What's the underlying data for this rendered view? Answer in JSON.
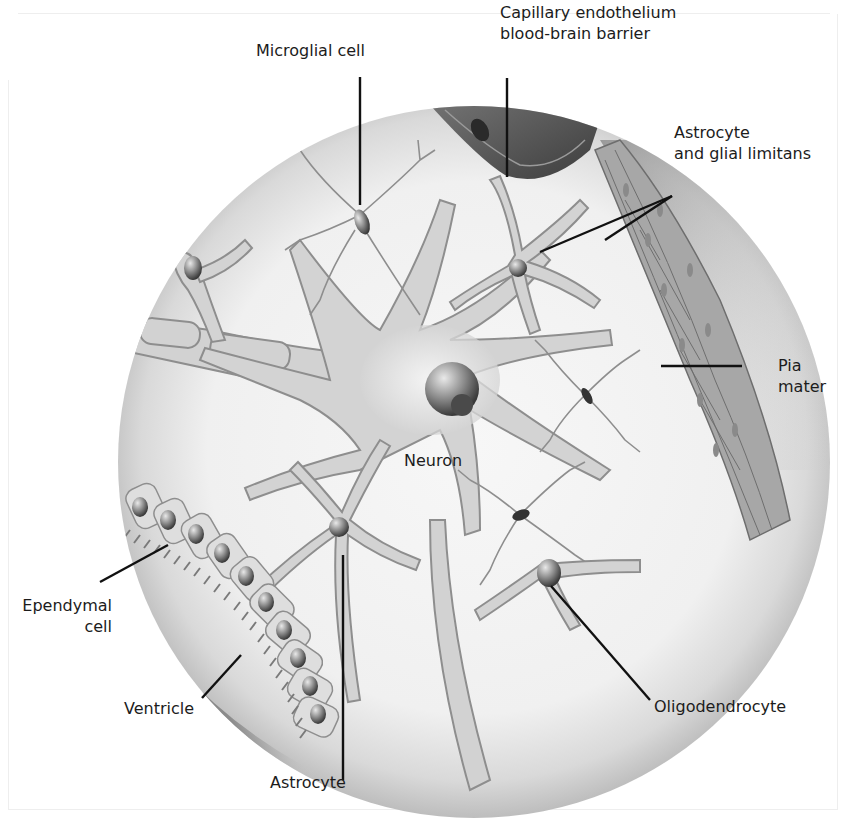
{
  "diagram": {
    "colors": {
      "background": "#ffffff",
      "tissue": "#efefef",
      "cell_fill": "#d2d2d2",
      "cell_outline": "#8e8e8e",
      "nucleus_dark": "#2e2e2e",
      "capillary": "#5a5a5a",
      "pia": "#9d9d9d",
      "ventricle": "#6b6b6b",
      "leader_line": "#111111",
      "text": "#1c1c1c"
    },
    "labels": {
      "microglial": "Microglial cell",
      "capillary_line1": "Capillary endothelium",
      "capillary_line2": "blood-brain barrier",
      "astro_glial_line1": "Astrocyte",
      "astro_glial_line2": "and glial limitans",
      "pia_line1": "Pia",
      "pia_line2": "mater",
      "neuron": "Neuron",
      "ependymal_line1": "Ependymal",
      "ependymal_line2": "cell",
      "ventricle": "Ventricle",
      "oligodendrocyte": "Oligodendrocyte",
      "astrocyte": "Astrocyte"
    }
  }
}
